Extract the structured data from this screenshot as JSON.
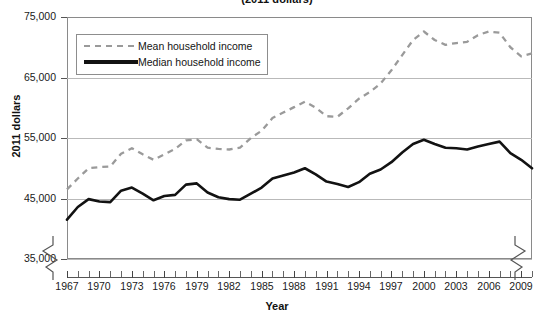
{
  "chart_data": {
    "type": "line",
    "title": "(2011 dollars)",
    "xlabel": "Year",
    "ylabel": "2011 dollars",
    "ylim": [
      35000,
      75000
    ],
    "xlim": [
      1967,
      2010
    ],
    "grid": true,
    "legend_position": "top-left",
    "y_ticks": [
      "35,000",
      "45,000",
      "55,000",
      "65,000",
      "75,000"
    ],
    "y_tick_values": [
      35000,
      45000,
      55000,
      65000,
      75000
    ],
    "x_ticks": [
      "1967",
      "1970",
      "1973",
      "1976",
      "1979",
      "1982",
      "1985",
      "1988",
      "1991",
      "1994",
      "1997",
      "2000",
      "2003",
      "2006",
      "2009"
    ],
    "x_tick_values": [
      1967,
      1970,
      1973,
      1976,
      1979,
      1982,
      1985,
      1988,
      1991,
      1994,
      1997,
      2000,
      2003,
      2006,
      2009
    ],
    "axis_break": true,
    "x": [
      1967,
      1968,
      1969,
      1970,
      1971,
      1972,
      1973,
      1974,
      1975,
      1976,
      1977,
      1978,
      1979,
      1980,
      1981,
      1982,
      1983,
      1984,
      1985,
      1986,
      1987,
      1988,
      1989,
      1990,
      1991,
      1992,
      1993,
      1994,
      1995,
      1996,
      1997,
      1998,
      1999,
      2000,
      2001,
      2002,
      2003,
      2004,
      2005,
      2006,
      2007,
      2008,
      2009,
      2010
    ],
    "series": [
      {
        "name": "Mean household income",
        "style": "dashed",
        "color": "#9a9a9a",
        "values": [
          46500,
          48300,
          50000,
          50200,
          50300,
          52400,
          53300,
          52300,
          51400,
          52300,
          53200,
          54600,
          54800,
          53400,
          53200,
          53100,
          53400,
          55000,
          56200,
          58300,
          59200,
          60100,
          61000,
          60000,
          58600,
          58500,
          59900,
          61500,
          62600,
          64000,
          66200,
          68700,
          71200,
          72600,
          71200,
          70400,
          70700,
          70900,
          72000,
          72600,
          72400,
          70000,
          68500,
          69000
        ]
      },
      {
        "name": "Median household income",
        "style": "solid",
        "color": "#121212",
        "values": [
          41500,
          43600,
          44900,
          44500,
          44400,
          46300,
          46800,
          45800,
          44700,
          45400,
          45600,
          47300,
          47500,
          46000,
          45200,
          44900,
          44800,
          45800,
          46800,
          48300,
          48800,
          49300,
          50000,
          49000,
          47800,
          47400,
          46900,
          47700,
          49100,
          49800,
          51000,
          52600,
          54000,
          54700,
          54000,
          53400,
          53300,
          53100,
          53600,
          54000,
          54400,
          52500,
          51400,
          50000
        ]
      }
    ]
  },
  "legend": {
    "items": [
      {
        "label": "Mean household income",
        "style": "dashed"
      },
      {
        "label": "Median household income",
        "style": "solid"
      }
    ]
  }
}
